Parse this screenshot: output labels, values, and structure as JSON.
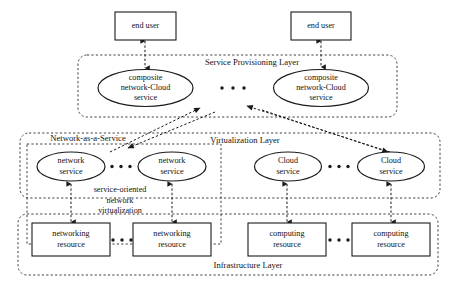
{
  "diagram": {
    "layers": [
      {
        "id": "service-provisioning",
        "label": "Service Provisioning Layer"
      },
      {
        "id": "virtualization",
        "label": "Virtualization Layer"
      },
      {
        "id": "naas",
        "label": "Network-as-a-Service"
      },
      {
        "id": "infrastructure",
        "label": "Infrastructure Layer"
      }
    ],
    "end_users": [
      {
        "label": "end user"
      },
      {
        "label": "end user"
      }
    ],
    "composite_services": [
      {
        "line1": "composite",
        "line2": "network-Cloud",
        "line3": "service"
      },
      {
        "line1": "composite",
        "line2": "network-Cloud",
        "line3": "service"
      }
    ],
    "network_services": [
      {
        "line1": "network",
        "line2": "service"
      },
      {
        "line1": "network",
        "line2": "service"
      }
    ],
    "cloud_services": [
      {
        "line1": "Cloud",
        "line2": "service"
      },
      {
        "line1": "Cloud",
        "line2": "service"
      }
    ],
    "networking_resources": [
      {
        "line1": "networking",
        "line2": "resource"
      },
      {
        "line1": "networking",
        "line2": "resource"
      }
    ],
    "computing_resources": [
      {
        "line1": "computing",
        "line2": "resource"
      },
      {
        "line1": "computing",
        "line2": "resource"
      }
    ],
    "side_annotation": {
      "line1": "service-oriented",
      "line2": "network",
      "line3": "virtualization"
    },
    "ellipsis_glyph": "• • •",
    "colors": {
      "stroke": "#1a1a1a",
      "dashed_stroke": "#2b2b2b",
      "text": "#121212",
      "background": "#ffffff"
    }
  }
}
